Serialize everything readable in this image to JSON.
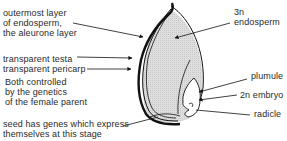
{
  "labels": {
    "aleurone": "outermost layer\nof endosperm,\nthe aleurone layer",
    "testa": "transparent testa",
    "pericarp": "transparent pericarp",
    "maternal": "Both controlled\nby the genetics\nof the female parent",
    "seed_genes": "seed has genes which express\nthemselves at this stage",
    "endosperm": "3n\nendosperm",
    "plumule": "plumule",
    "embryo": "2n embryo",
    "radicle": "radicle"
  },
  "colors": {
    "endosperm_fill": "#dcdcdc",
    "outline": "#111111",
    "text": "#2a2a2a"
  }
}
